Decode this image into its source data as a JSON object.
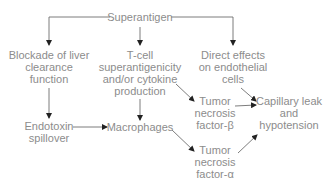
{
  "diagram": {
    "type": "flowchart",
    "nodes": {
      "superantigen": {
        "lines": [
          "Superantigen"
        ]
      },
      "blockade": {
        "lines": [
          "Blockade of liver",
          "clearance",
          "function"
        ]
      },
      "tcell": {
        "lines": [
          "T-cell",
          "superantigenicity",
          "and/or cytokine",
          "production"
        ]
      },
      "direct": {
        "lines": [
          "Direct effects",
          "on endothelial",
          "cells"
        ]
      },
      "endotoxin": {
        "lines": [
          "Endotoxin",
          "spillover"
        ]
      },
      "macrophages": {
        "lines": [
          "Macrophages"
        ]
      },
      "tnf_beta": {
        "lines": [
          "Tumor",
          "necrosis",
          "factor-β"
        ]
      },
      "capillary": {
        "lines": [
          "Capillary leak",
          "and",
          "hypotension"
        ]
      },
      "tnf_alpha": {
        "lines": [
          "Tumor",
          "necrosis",
          "factor-α"
        ]
      }
    },
    "edges": [
      {
        "from": "Superantigen",
        "to": "Blockade of liver clearance function"
      },
      {
        "from": "Superantigen",
        "to": "T-cell superantigenicity and/or cytokine production"
      },
      {
        "from": "Superantigen",
        "to": "Direct effects on endothelial cells"
      },
      {
        "from": "Blockade of liver clearance function",
        "to": "Endotoxin spillover"
      },
      {
        "from": "Endotoxin spillover",
        "to": "Macrophages"
      },
      {
        "from": "T-cell superantigenicity and/or cytokine production",
        "to": "Macrophages"
      },
      {
        "from": "T-cell superantigenicity and/or cytokine production",
        "to": "Tumor necrosis factor-β"
      },
      {
        "from": "Macrophages",
        "to": "Tumor necrosis factor-α"
      },
      {
        "from": "Direct effects on endothelial cells",
        "to": "Capillary leak and hypotension"
      },
      {
        "from": "Tumor necrosis factor-β",
        "to": "Capillary leak and hypotension"
      },
      {
        "from": "Tumor necrosis factor-α",
        "to": "Capillary leak and hypotension"
      }
    ],
    "colors": {
      "text": "#8c8c8c",
      "line": "#6e6e6e",
      "arrow": "#222222"
    }
  }
}
